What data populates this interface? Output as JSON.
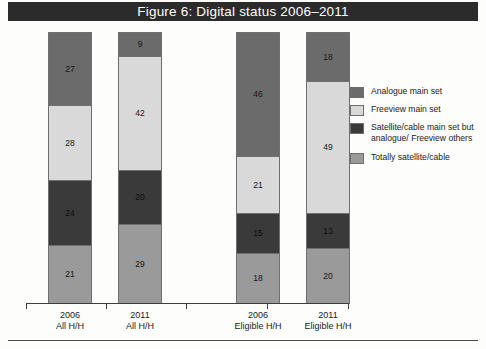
{
  "figure": {
    "title": "Figure 6: Digital status 2006–2011"
  },
  "legend": {
    "items": [
      {
        "label": "Analogue main set",
        "color": "#6b6b6b",
        "key": "analogue"
      },
      {
        "label": "Freeview main set",
        "color": "#d9d9d9",
        "key": "freeview"
      },
      {
        "label": "Satellite/cable main set but analogue/ Freeview others",
        "color": "#3a3a3a",
        "key": "satmain"
      },
      {
        "label": "Totally satellite/cable",
        "color": "#9a9a9a",
        "key": "totalsat"
      }
    ]
  },
  "axis": {
    "categories": [
      {
        "line1": "2006",
        "line2": "All H/H"
      },
      {
        "line1": "2011",
        "line2": "All H/H"
      },
      {
        "line1": "2006",
        "line2": "Eligible H/H"
      },
      {
        "line1": "2011",
        "line2": "Eligible H/H"
      }
    ]
  },
  "bars": [
    {
      "segments": [
        {
          "value": "27",
          "key": "analogue"
        },
        {
          "value": "28",
          "key": "freeview"
        },
        {
          "value": "24",
          "key": "satmain"
        },
        {
          "value": "21",
          "key": "totalsat"
        }
      ]
    },
    {
      "segments": [
        {
          "value": "9",
          "key": "analogue"
        },
        {
          "value": "42",
          "key": "freeview"
        },
        {
          "value": "20",
          "key": "satmain"
        },
        {
          "value": "29",
          "key": "totalsat"
        }
      ]
    },
    {
      "segments": [
        {
          "value": "46",
          "key": "analogue"
        },
        {
          "value": "21",
          "key": "freeview"
        },
        {
          "value": "15",
          "key": "satmain"
        },
        {
          "value": "18",
          "key": "totalsat"
        }
      ]
    },
    {
      "segments": [
        {
          "value": "18",
          "key": "analogue"
        },
        {
          "value": "49",
          "key": "freeview"
        },
        {
          "value": "13",
          "key": "satmain"
        },
        {
          "value": "20",
          "key": "totalsat"
        }
      ]
    }
  ],
  "chart_data": {
    "type": "bar",
    "subtype": "stacked-100-percent",
    "title": "Figure 6: Digital status 2006–2011",
    "xlabel": "",
    "ylabel": "",
    "ylim": [
      0,
      100
    ],
    "grid": false,
    "legend_position": "right",
    "categories": [
      "2006 All H/H",
      "2011 All H/H",
      "2006 Eligible H/H",
      "2011 Eligible H/H"
    ],
    "series": [
      {
        "name": "Analogue main set",
        "color": "#6b6b6b",
        "values": [
          27,
          9,
          46,
          18
        ]
      },
      {
        "name": "Freeview main set",
        "color": "#d9d9d9",
        "values": [
          28,
          42,
          21,
          49
        ]
      },
      {
        "name": "Satellite/cable main set but analogue/ Freeview others",
        "color": "#3a3a3a",
        "values": [
          24,
          20,
          15,
          13
        ]
      },
      {
        "name": "Totally satellite/cable",
        "color": "#9a9a9a",
        "values": [
          21,
          29,
          18,
          20
        ]
      }
    ],
    "stack_order_bottom_to_top": [
      "Totally satellite/cable",
      "Satellite/cable main set but analogue/ Freeview others",
      "Freeview main set",
      "Analogue main set"
    ],
    "units": "percent of households"
  }
}
